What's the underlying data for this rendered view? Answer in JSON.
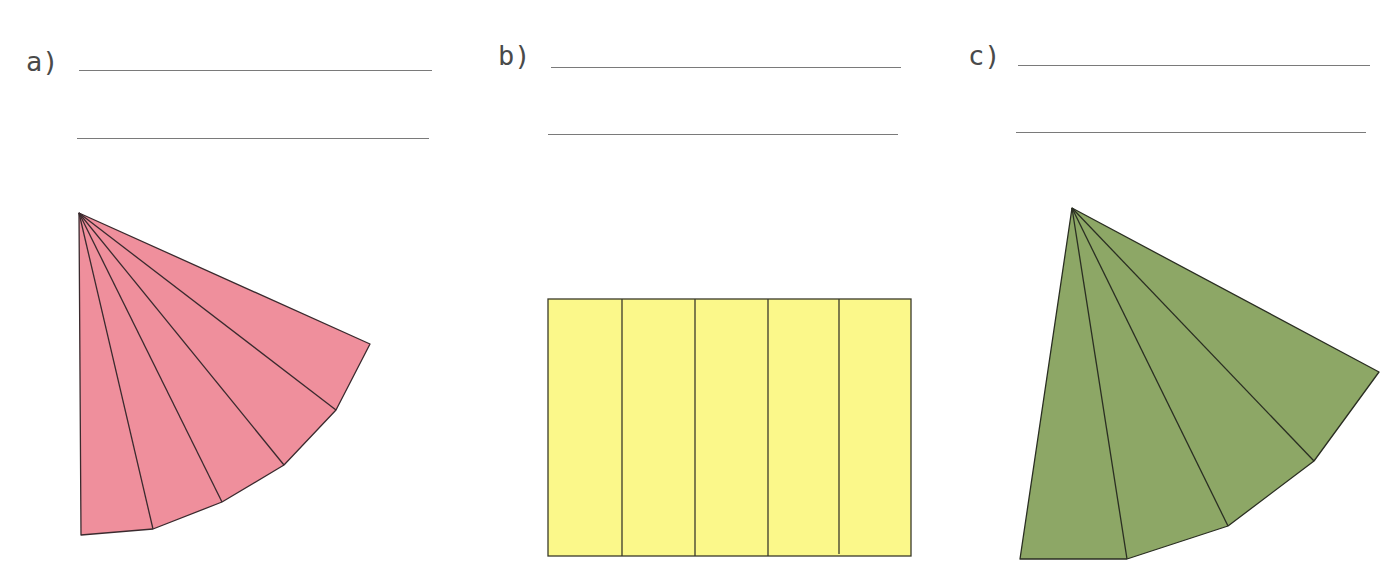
{
  "exercises": [
    {
      "label": "a)",
      "answer_lines": [
        "",
        ""
      ],
      "figure": {
        "name": "pink-cone-net",
        "shape": "fan of 6 triangular faces from a common apex",
        "face_count": 6,
        "fill": "#ef8f9c",
        "stroke": "#3a2a2e"
      }
    },
    {
      "label": "b)",
      "answer_lines": [
        "",
        ""
      ],
      "figure": {
        "name": "yellow-rectangle-net",
        "shape": "rectangle divided into 5 vertical strips",
        "face_count": 5,
        "fill": "#fbf88a",
        "stroke": "#3a3a2a"
      }
    },
    {
      "label": "c)",
      "answer_lines": [
        "",
        ""
      ],
      "figure": {
        "name": "green-cone-net",
        "shape": "fan of 5 triangular faces from a common apex",
        "face_count": 5,
        "fill": "#8da766",
        "stroke": "#2a2e22"
      }
    }
  ]
}
